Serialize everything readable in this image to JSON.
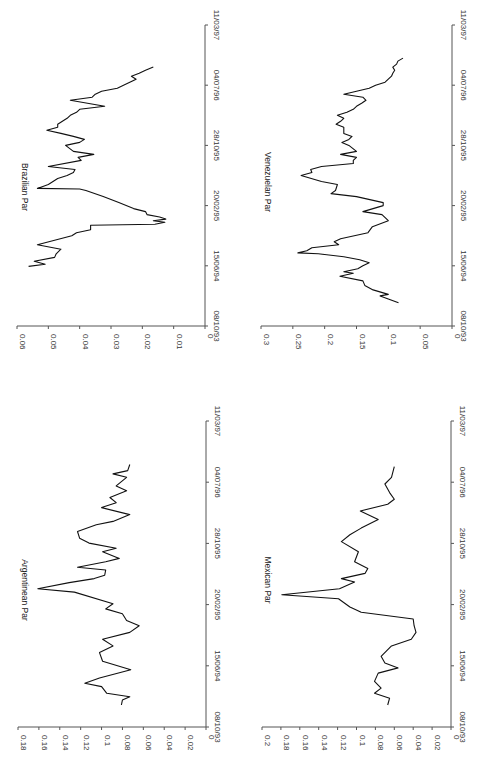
{
  "chart_data": [
    {
      "type": "line",
      "title": "Brazilian Par",
      "xlabel": "",
      "ylabel": "",
      "x_ticks": [
        "08/10/93",
        "15/06/94",
        "20/02/95",
        "28/10/95",
        "04/07/96",
        "11/03/97"
      ],
      "y_ticks": [
        "0",
        "0.01",
        "0.02",
        "0.03",
        "0.04",
        "0.05",
        "0.06"
      ],
      "ylim": [
        0,
        0.06
      ],
      "grid": false,
      "orientation": "rotated-90-ccw",
      "x_note": "x is fraction of date axis from 08/10/93 (0) to 11/03/97 (1)",
      "x": [
        0.198,
        0.205,
        0.215,
        0.228,
        0.24,
        0.255,
        0.27,
        0.3,
        0.31,
        0.32,
        0.335,
        0.338,
        0.345,
        0.35,
        0.355,
        0.362,
        0.37,
        0.38,
        0.39,
        0.41,
        0.42,
        0.43,
        0.45,
        0.455,
        0.457,
        0.47,
        0.48,
        0.49,
        0.5,
        0.51,
        0.52,
        0.53,
        0.55,
        0.56,
        0.57,
        0.58,
        0.6,
        0.61,
        0.62,
        0.63,
        0.64,
        0.65,
        0.66,
        0.67,
        0.69,
        0.7,
        0.71,
        0.72,
        0.73,
        0.75,
        0.76,
        0.77,
        0.78,
        0.79,
        0.8,
        0.81,
        0.82,
        0.83,
        0.84,
        0.85,
        0.86
      ],
      "values": [
        0.0563,
        0.051,
        0.0545,
        0.048,
        0.0475,
        0.046,
        0.0535,
        0.0425,
        0.041,
        0.0365,
        0.0365,
        0.016,
        0.0128,
        0.0165,
        0.0125,
        0.0145,
        0.0185,
        0.019,
        0.0228,
        0.0275,
        0.03,
        0.0325,
        0.038,
        0.04,
        0.0535,
        0.05,
        0.0485,
        0.047,
        0.044,
        0.042,
        0.0415,
        0.05,
        0.0395,
        0.0405,
        0.0355,
        0.042,
        0.0445,
        0.04,
        0.0385,
        0.042,
        0.046,
        0.0505,
        0.047,
        0.047,
        0.044,
        0.043,
        0.041,
        0.04,
        0.032,
        0.043,
        0.036,
        0.035,
        0.033,
        0.028,
        0.026,
        0.024,
        0.022,
        0.0235,
        0.021,
        0.019,
        0.0165
      ]
    },
    {
      "type": "line",
      "title": "Venezuelan Par",
      "xlabel": "",
      "ylabel": "",
      "x_ticks": [
        "08/10/93",
        "15/06/94",
        "20/02/95",
        "28/10/95",
        "04/07/96",
        "11/03/97"
      ],
      "y_ticks": [
        "0",
        "0.05",
        "0.1",
        "0.15",
        "0.2",
        "0.25",
        "0.3"
      ],
      "ylim": [
        0,
        0.3
      ],
      "grid": false,
      "orientation": "rotated-90-ccw",
      "x_note": "x is fraction of date axis from 08/10/93 (0) to 11/03/97 (1)",
      "x": [
        0.077,
        0.09,
        0.1,
        0.105,
        0.12,
        0.135,
        0.15,
        0.165,
        0.175,
        0.18,
        0.19,
        0.2,
        0.21,
        0.22,
        0.23,
        0.24,
        0.243,
        0.25,
        0.26,
        0.27,
        0.28,
        0.29,
        0.31,
        0.33,
        0.35,
        0.37,
        0.38,
        0.4,
        0.41,
        0.43,
        0.44,
        0.45,
        0.47,
        0.48,
        0.5,
        0.51,
        0.52,
        0.53,
        0.54,
        0.55,
        0.56,
        0.57,
        0.58,
        0.6,
        0.61,
        0.62,
        0.63,
        0.64,
        0.66,
        0.67,
        0.68,
        0.69,
        0.7,
        0.71,
        0.72,
        0.73,
        0.74,
        0.75,
        0.76,
        0.77,
        0.78,
        0.79,
        0.8,
        0.81,
        0.82,
        0.83,
        0.84,
        0.85,
        0.86,
        0.87,
        0.88,
        0.89
      ],
      "values": [
        0.084,
        0.1,
        0.113,
        0.1,
        0.124,
        0.137,
        0.14,
        0.176,
        0.155,
        0.17,
        0.148,
        0.14,
        0.13,
        0.145,
        0.17,
        0.21,
        0.242,
        0.228,
        0.22,
        0.178,
        0.185,
        0.175,
        0.132,
        0.125,
        0.1,
        0.11,
        0.14,
        0.108,
        0.108,
        0.15,
        0.19,
        0.183,
        0.18,
        0.205,
        0.237,
        0.22,
        0.222,
        0.205,
        0.155,
        0.155,
        0.15,
        0.175,
        0.15,
        0.162,
        0.173,
        0.162,
        0.157,
        0.17,
        0.17,
        0.182,
        0.175,
        0.17,
        0.18,
        0.165,
        0.155,
        0.15,
        0.142,
        0.135,
        0.14,
        0.17,
        0.15,
        0.13,
        0.12,
        0.105,
        0.1,
        0.095,
        0.093,
        0.09,
        0.093,
        0.087,
        0.085,
        0.077
      ]
    },
    {
      "type": "line",
      "title": "Argentinean Par",
      "xlabel": "",
      "ylabel": "",
      "x_ticks": [
        "08/10/93",
        "15/06/94",
        "20/02/95",
        "28/10/95",
        "04/07/96",
        "11/03/97"
      ],
      "y_ticks": [
        "0",
        "0.02",
        "0.04",
        "0.06",
        "0.08",
        "0.1",
        "0.12",
        "0.14",
        "0.16",
        "0.18"
      ],
      "ylim": [
        0,
        0.18
      ],
      "grid": false,
      "orientation": "rotated-90-ccw",
      "x_note": "x is fraction of date axis from 08/10/93 (0) to 11/03/97 (1)",
      "x": [
        0.072,
        0.088,
        0.099,
        0.11,
        0.132,
        0.143,
        0.16,
        0.187,
        0.215,
        0.243,
        0.265,
        0.287,
        0.309,
        0.331,
        0.348,
        0.37,
        0.386,
        0.403,
        0.441,
        0.452,
        0.472,
        0.485,
        0.496,
        0.513,
        0.522,
        0.54,
        0.551,
        0.573,
        0.584,
        0.601,
        0.617,
        0.639,
        0.661,
        0.672,
        0.694,
        0.717,
        0.733,
        0.75,
        0.772,
        0.788,
        0.816,
        0.827,
        0.838,
        0.858
      ],
      "values": [
        0.081,
        0.08,
        0.073,
        0.095,
        0.1,
        0.116,
        0.102,
        0.072,
        0.099,
        0.102,
        0.089,
        0.099,
        0.073,
        0.064,
        0.076,
        0.08,
        0.096,
        0.089,
        0.126,
        0.161,
        0.131,
        0.107,
        0.097,
        0.096,
        0.123,
        0.096,
        0.083,
        0.099,
        0.086,
        0.112,
        0.121,
        0.123,
        0.105,
        0.089,
        0.073,
        0.1,
        0.086,
        0.092,
        0.076,
        0.086,
        0.076,
        0.089,
        0.075,
        0.073
      ]
    },
    {
      "type": "line",
      "title": "Mexican Par",
      "xlabel": "",
      "ylabel": "",
      "x_ticks": [
        "08/10/93",
        "15/06/94",
        "20/02/95",
        "28/10/95",
        "04/07/96",
        "11/03/97"
      ],
      "y_ticks": [
        "0",
        "0.02",
        "0.04",
        "0.06",
        "0.08",
        "0.1",
        "0.12",
        "0.14",
        "0.16",
        "0.18",
        "0.2"
      ],
      "ylim": [
        0,
        0.2
      ],
      "grid": false,
      "orientation": "rotated-90-ccw",
      "x_note": "x is fraction of date axis from 08/10/93 (0) to 11/03/97 (1)",
      "x": [
        0.072,
        0.094,
        0.11,
        0.127,
        0.149,
        0.176,
        0.193,
        0.209,
        0.231,
        0.265,
        0.287,
        0.309,
        0.331,
        0.353,
        0.375,
        0.392,
        0.419,
        0.432,
        0.452,
        0.474,
        0.485,
        0.502,
        0.518,
        0.54,
        0.573,
        0.606,
        0.628,
        0.65,
        0.678,
        0.706,
        0.728,
        0.744,
        0.766,
        0.794,
        0.816,
        0.851
      ],
      "values": [
        0.067,
        0.065,
        0.081,
        0.074,
        0.081,
        0.077,
        0.056,
        0.07,
        0.074,
        0.063,
        0.042,
        0.037,
        0.039,
        0.04,
        0.095,
        0.107,
        0.119,
        0.179,
        0.118,
        0.102,
        0.116,
        0.091,
        0.088,
        0.102,
        0.098,
        0.116,
        0.107,
        0.095,
        0.077,
        0.096,
        0.067,
        0.06,
        0.065,
        0.07,
        0.063,
        0.06
      ]
    }
  ],
  "panels": [
    {
      "title": "Brazilian Par",
      "chart_index": 0,
      "axis_y": 326,
      "val_left": 17,
      "val_right": 205,
      "date_top": 25,
      "title_x": 22,
      "title_y": 187
    },
    {
      "title": "Venezuelan Par",
      "chart_index": 1,
      "axis_y": 326,
      "val_left": 261,
      "val_right": 452,
      "date_top": 25,
      "title_x": 265,
      "title_y": 182
    },
    {
      "title": "Argentinean Par",
      "chart_index": 2,
      "axis_y": 727,
      "val_left": 18,
      "val_right": 206,
      "date_top": 421,
      "title_x": 22,
      "title_y": 590
    },
    {
      "title": "Mexican Par",
      "chart_index": 3,
      "axis_y": 727,
      "val_left": 262,
      "val_right": 451,
      "date_top": 421,
      "title_x": 265,
      "title_y": 580
    }
  ]
}
